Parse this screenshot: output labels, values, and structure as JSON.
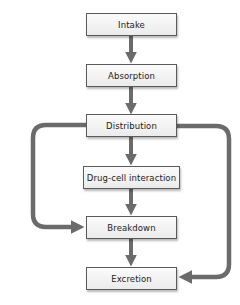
{
  "diagram": {
    "type": "flowchart",
    "colors": {
      "arrow": "#6b6b6b",
      "box_border": "#5a5a5a",
      "box_fill_top": "#fbfbfb",
      "box_fill_bottom": "#ebebeb",
      "text": "#222222"
    },
    "nodes": [
      {
        "id": "intake",
        "label": "Intake"
      },
      {
        "id": "absorption",
        "label": "Absorption"
      },
      {
        "id": "distribution",
        "label": "Distribution"
      },
      {
        "id": "drug_cell_interaction",
        "label": "Drug-cell interaction"
      },
      {
        "id": "breakdown",
        "label": "Breakdown"
      },
      {
        "id": "excretion",
        "label": "Excretion"
      }
    ],
    "edges": [
      {
        "from": "Intake",
        "to": "Absorption"
      },
      {
        "from": "Absorption",
        "to": "Distribution"
      },
      {
        "from": "Distribution",
        "to": "Drug-cell interaction"
      },
      {
        "from": "Drug-cell interaction",
        "to": "Breakdown"
      },
      {
        "from": "Breakdown",
        "to": "Excretion"
      },
      {
        "from": "Distribution",
        "to": "Breakdown",
        "route": "left-bypass"
      },
      {
        "from": "Distribution",
        "to": "Excretion",
        "route": "right-bypass"
      }
    ]
  }
}
